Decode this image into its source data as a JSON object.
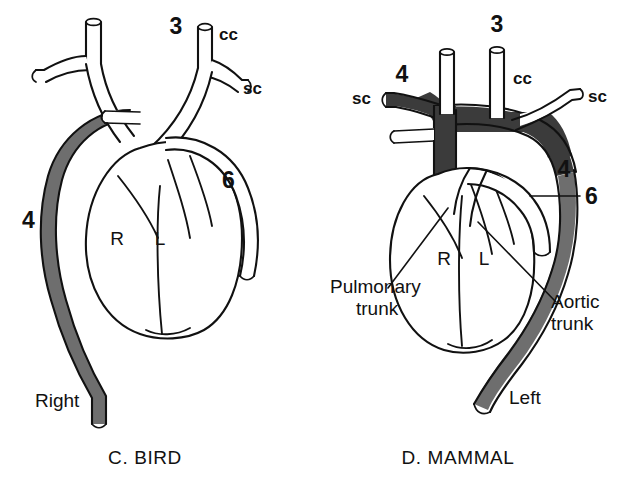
{
  "figure": {
    "type": "anatomical-diagram",
    "background_color": "#ffffff",
    "ink_color": "#111111",
    "shaded_vessel_color": "#3b3b3b",
    "panels": [
      {
        "id": "bird",
        "caption": "C. BIRD",
        "chambers": [
          {
            "key": "right",
            "label": "R"
          },
          {
            "key": "left",
            "label": "L"
          }
        ],
        "labels": [
          {
            "key": "arch3",
            "text": "3"
          },
          {
            "key": "cc",
            "text": "cc"
          },
          {
            "key": "sc",
            "text": "sc"
          },
          {
            "key": "arch6",
            "text": "6"
          },
          {
            "key": "arch4",
            "text": "4"
          },
          {
            "key": "side",
            "text": "Right"
          }
        ]
      },
      {
        "id": "mammal",
        "caption": "D. MAMMAL",
        "chambers": [
          {
            "key": "right",
            "label": "R"
          },
          {
            "key": "left",
            "label": "L"
          }
        ],
        "labels": [
          {
            "key": "arch3",
            "text": "3"
          },
          {
            "key": "cc",
            "text": "cc"
          },
          {
            "key": "sc_left",
            "text": "sc"
          },
          {
            "key": "sc_right",
            "text": "sc"
          },
          {
            "key": "arch4_left",
            "text": "4"
          },
          {
            "key": "arch4_right",
            "text": "4"
          },
          {
            "key": "arch6",
            "text": "6"
          },
          {
            "key": "pulmonary_trunk_line1",
            "text": "Pulmonary"
          },
          {
            "key": "pulmonary_trunk_line2",
            "text": "trunk"
          },
          {
            "key": "aortic_trunk_line1",
            "text": "Aortic"
          },
          {
            "key": "aortic_trunk_line2",
            "text": "trunk"
          },
          {
            "key": "side",
            "text": "Left"
          }
        ]
      }
    ]
  }
}
